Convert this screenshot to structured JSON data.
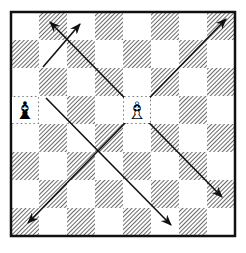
{
  "diagram": {
    "type": "chessboard",
    "orientation": "white-bottom",
    "board": {
      "x": 11,
      "y": 12,
      "size": 224,
      "squares": 8
    },
    "colors": {
      "light": "#ffffff",
      "dark_hatch": "#5a5a5a",
      "border": "#111111",
      "arrow": "#111111"
    },
    "pieces": [
      {
        "name": "black-bishop",
        "square": "a5",
        "glyph": "♝",
        "color": "black"
      },
      {
        "name": "white-bishop",
        "square": "e5",
        "glyph": "♗",
        "color": "white"
      }
    ],
    "arrows": [
      {
        "from": [
          43,
          67
        ],
        "to": [
          80,
          24
        ],
        "head_start": false,
        "head_end": true
      },
      {
        "from": [
          46,
          98
        ],
        "to": [
          171,
          225
        ],
        "head_start": false,
        "head_end": true
      },
      {
        "from": [
          222,
          197
        ],
        "to": [
          50,
          22
        ],
        "head_start": true,
        "head_end": true
      },
      {
        "from": [
          28,
          223
        ],
        "to": [
          226,
          19
        ],
        "head_start": true,
        "head_end": true
      }
    ]
  }
}
